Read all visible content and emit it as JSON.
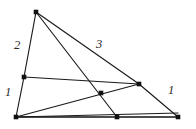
{
  "figure": {
    "width": 196,
    "height": 129,
    "background_color": "#ffffff",
    "stroke_color": "#1a1a1a",
    "base_stroke_color": "#555555",
    "node_color": "#111111",
    "vertices": [
      {
        "name": "apex",
        "x": 36,
        "y": 12
      },
      {
        "name": "bottom-left",
        "x": 16,
        "y": 117
      },
      {
        "name": "bottom-right",
        "x": 178,
        "y": 117
      },
      {
        "name": "left-edge-point",
        "x": 24,
        "y": 77
      },
      {
        "name": "right-edge-point",
        "x": 139,
        "y": 84
      },
      {
        "name": "bottom-edge-point",
        "x": 117,
        "y": 117
      },
      {
        "name": "interior-intersection",
        "x": 101,
        "y": 93
      }
    ],
    "segments": [
      {
        "name": "left-side-upper",
        "x1": 36,
        "y1": 12,
        "x2": 24,
        "y2": 77,
        "style": "edge"
      },
      {
        "name": "left-side-lower",
        "x1": 24,
        "y1": 77,
        "x2": 16,
        "y2": 117,
        "style": "edge"
      },
      {
        "name": "base-left",
        "x1": 16,
        "y1": 117,
        "x2": 117,
        "y2": 117,
        "style": "base"
      },
      {
        "name": "base-right",
        "x1": 117,
        "y1": 117,
        "x2": 178,
        "y2": 117,
        "style": "base"
      },
      {
        "name": "right-side-upper",
        "x1": 36,
        "y1": 12,
        "x2": 139,
        "y2": 84,
        "style": "edge"
      },
      {
        "name": "right-side-lower",
        "x1": 139,
        "y1": 84,
        "x2": 178,
        "y2": 117,
        "style": "edge"
      },
      {
        "name": "cevian-apex-to-base",
        "x1": 36,
        "y1": 12,
        "x2": 117,
        "y2": 117,
        "style": "edge"
      },
      {
        "name": "cevian-leftpoint-to-rightpoint",
        "x1": 24,
        "y1": 77,
        "x2": 139,
        "y2": 84,
        "style": "edge"
      },
      {
        "name": "cevian-bottomleft-to-rightpoint",
        "x1": 16,
        "y1": 117,
        "x2": 139,
        "y2": 84,
        "style": "edge"
      },
      {
        "name": "cevian-bottomleft-to-bottomright",
        "x1": 16,
        "y1": 117,
        "x2": 178,
        "y2": 117,
        "style": "edge"
      },
      {
        "name": "cevian-bottomleft-to-interior-extended",
        "x1": 16,
        "y1": 117,
        "x2": 178,
        "y2": 113,
        "style": "edge"
      }
    ],
    "labels": [
      {
        "name": "label-2-upper-left",
        "text": "2",
        "x": 14,
        "y": 39
      },
      {
        "name": "label-1-lower-left",
        "text": "1",
        "x": 5,
        "y": 86
      },
      {
        "name": "label-3-upper-right",
        "text": "3",
        "x": 96,
        "y": 38
      },
      {
        "name": "label-1-right",
        "text": "1",
        "x": 168,
        "y": 84
      }
    ]
  }
}
